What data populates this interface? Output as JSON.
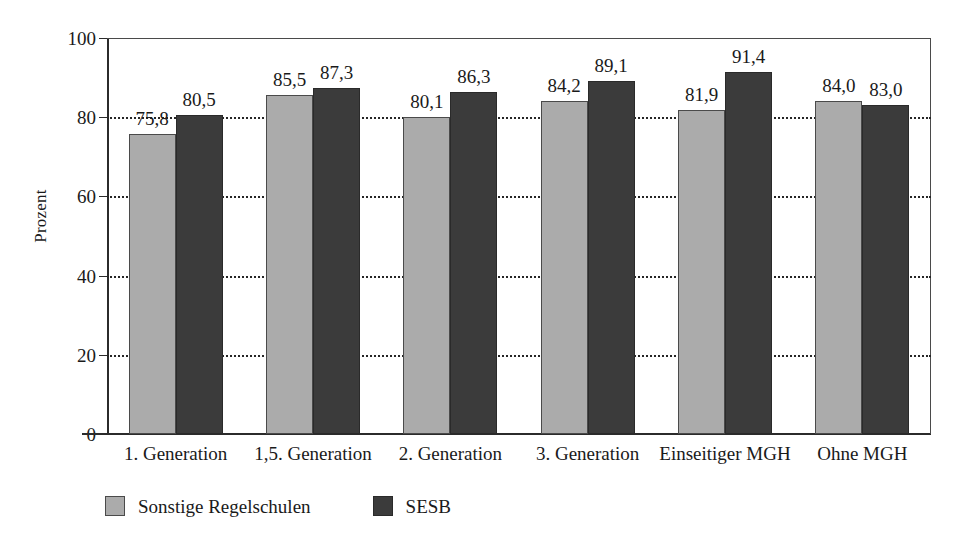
{
  "chart_data": {
    "type": "bar",
    "title": "",
    "xlabel": "",
    "ylabel": "Prozent",
    "ylim": [
      0,
      100
    ],
    "yticks": [
      0,
      20,
      40,
      60,
      80,
      100
    ],
    "ytick_labels": [
      "0",
      "20",
      "40",
      "60",
      "80",
      "100"
    ],
    "grid": "horizontal dotted",
    "legend_position": "below-left",
    "categories": [
      "1. Generation",
      "1,5. Generation",
      "2. Generation",
      "3. Generation",
      "Einseitiger MGH",
      "Ohne MGH"
    ],
    "series": [
      {
        "name": "Sonstige Regelschulen",
        "color": "#ababab",
        "values": [
          75.8,
          85.5,
          80.1,
          84.2,
          81.9,
          84.0
        ],
        "labels": [
          "75,8",
          "85,5",
          "80,1",
          "84,2",
          "81,9",
          "84,0"
        ]
      },
      {
        "name": "SESB",
        "color": "#3b3b3b",
        "values": [
          80.5,
          87.3,
          86.3,
          89.1,
          91.4,
          83.0
        ],
        "labels": [
          "80,5",
          "87,3",
          "86,3",
          "89,1",
          "91,4",
          "83,0"
        ]
      }
    ]
  },
  "colors": {
    "series_light": "#ababab",
    "series_dark": "#3b3b3b",
    "axis": "#2b2b2b",
    "grid": "#262626",
    "background": "#ffffff"
  }
}
